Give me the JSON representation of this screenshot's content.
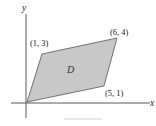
{
  "diagram": {
    "type": "parallelogram-region",
    "axes": {
      "x_label": "x",
      "y_label": "y"
    },
    "region": {
      "label": "D",
      "fill": "#c8c8c8",
      "stroke": "#555555"
    },
    "vertices": [
      {
        "coord": [
          0,
          0
        ],
        "label": ""
      },
      {
        "coord": [
          5,
          1
        ],
        "label": "(5, 1)"
      },
      {
        "coord": [
          6,
          4
        ],
        "label": "(6, 4)"
      },
      {
        "coord": [
          1,
          3
        ],
        "label": "(1, 3)"
      }
    ]
  }
}
